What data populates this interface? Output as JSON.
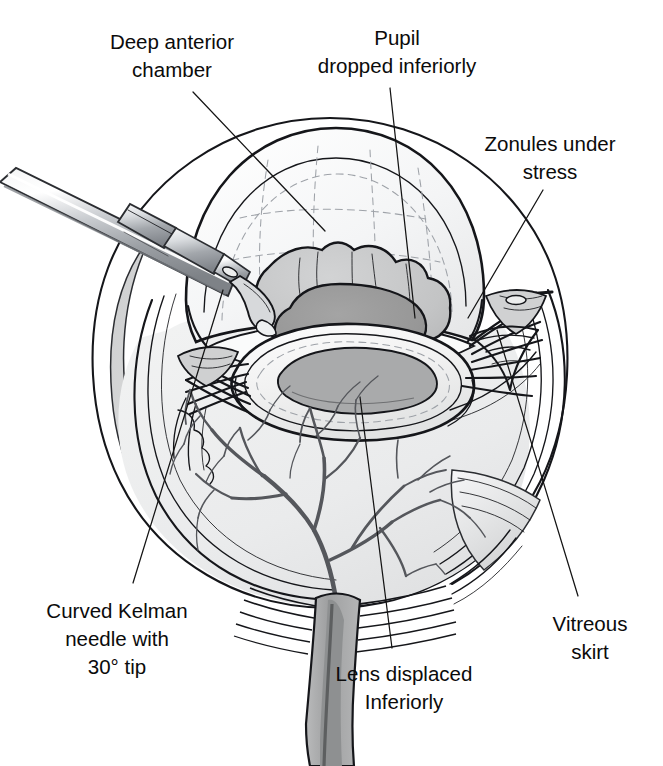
{
  "figure": {
    "kind": "medical-illustration",
    "line_art_color": "#15161a",
    "background_color": "#ffffff",
    "palette": {
      "ink": "#15161a",
      "label_text": "#0b0b0b",
      "leader_line": "#141414",
      "sclera_fill": "#ffffff",
      "vitreous_fill": "#eceded",
      "choroid_fill": "#d9dadb",
      "cornea_fill": "#f7f8f8",
      "lens_capsule_fill": "#f2f2f2",
      "lens_cortex_fill": "#c6c7c8",
      "pupil_fill": "#9a9a9a",
      "iris_fill": "#bdbebf",
      "instrument_light": "#f0f1f2",
      "instrument_mid": "#b9bcc0",
      "instrument_dark": "#85898e",
      "vessel_stroke": "#55575c",
      "faint_dash": "#9ea2a8"
    },
    "labels": [
      {
        "id": "deep-anterior-chamber",
        "lines": [
          "Deep anterior",
          "chamber"
        ],
        "text_x": 172,
        "text_y": 49,
        "line_height": 28,
        "align": "middle",
        "leader": "M 193 92 L 325 231"
      },
      {
        "id": "pupil-dropped-inferiorly",
        "lines": [
          "Pupil",
          "dropped inferiorly"
        ],
        "text_x": 397,
        "text_y": 45,
        "line_height": 28,
        "align": "middle",
        "leader": "M 390 88 L 415 318"
      },
      {
        "id": "zonules-under-stress",
        "lines": [
          "Zonules under",
          "stress"
        ],
        "text_x": 550,
        "text_y": 151,
        "line_height": 28,
        "align": "middle",
        "leader": "M 543 190 L 468 318"
      },
      {
        "id": "vitreous-skirt",
        "lines": [
          "Vitreous",
          "skirt"
        ],
        "text_x": 590,
        "text_y": 631,
        "line_height": 28,
        "align": "middle",
        "leader": "M 578 596 L 497 330"
      },
      {
        "id": "lens-displaced-inferiorly",
        "lines": [
          "Lens displaced",
          "Inferiorly"
        ],
        "text_x": 404,
        "text_y": 681,
        "line_height": 28,
        "align": "middle",
        "leader": "M 392 648 L 360 397"
      },
      {
        "id": "curved-kelman-needle",
        "lines": [
          "Curved Kelman",
          "needle with",
          "30° tip"
        ],
        "text_x": 117,
        "text_y": 618,
        "line_height": 28,
        "align": "middle",
        "leader": "M 133 583 L 223 290"
      }
    ],
    "annotated_structures": [
      "cornea",
      "deep anterior chamber",
      "iris with inferiorly dropped pupil",
      "crystalline lens displaced inferiorly",
      "zonular fibers under stress",
      "vitreous skirt",
      "sclera and choroid layers",
      "retinal vasculature",
      "optic nerve",
      "curved Kelman needle with 30 degree tip"
    ]
  }
}
